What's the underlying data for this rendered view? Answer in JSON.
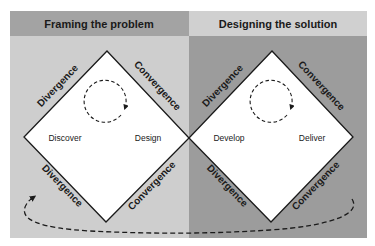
{
  "phases": [
    {
      "title": "Framing the problem",
      "header_color": "#a3a3a3",
      "body_color": "#cecece",
      "stages": [
        "Discover",
        "Design"
      ],
      "edges": {
        "top_left": "Divergence",
        "top_right": "Convergence",
        "bottom_left": "Divergence",
        "bottom_right": "Convergence"
      }
    },
    {
      "title": "Designing the solution",
      "header_color": "#d0d0d0",
      "body_color": "#9c9c9c",
      "stages": [
        "Develop",
        "Deliver"
      ],
      "edges": {
        "top_left": "Divergence",
        "top_right": "Convergence",
        "bottom_left": "Divergence",
        "bottom_right": "Convergence"
      }
    }
  ],
  "icons": {
    "iteration_loop": "dashed-circular-arrow",
    "return_loop": "dashed-curved-return-arrow"
  },
  "colors": {
    "diamond_fill": "#ffffff",
    "stroke": "#1a1a1a",
    "text": "#1a1a1a"
  }
}
